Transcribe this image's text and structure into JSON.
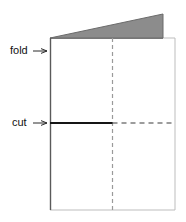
{
  "figure": {
    "background_color": "#ffffff",
    "labels": {
      "fold": "fold",
      "cut": "cut"
    },
    "arrow_glyph": "→",
    "colors": {
      "wedge_fill": "#8c8c8c",
      "wedge_stroke": "#6b6b6b",
      "fold_edge": "#5a5a5a",
      "sheet_edge": "#bdbdbd",
      "center_dash": "#9a9a9a",
      "cut_solid": "#151515",
      "cut_dash": "#3a3a3a",
      "text": "#111111",
      "arrow": "#2a2a2a"
    },
    "geometry": {
      "sheet": {
        "left": 50,
        "top": 38,
        "right": 175,
        "bottom": 210
      },
      "wedge": {
        "apex_x": 50,
        "apex_y": 38,
        "peak_x": 163,
        "peak_y": 14,
        "base_right_x": 163,
        "base_right_y": 38
      },
      "center_line_x": 112,
      "cut_line_y": 123
    },
    "annotations": [
      {
        "name": "fold",
        "text_x": 10,
        "text_y": 51,
        "arrow_x1": 33,
        "arrow_x2": 47,
        "arrow_y": 51,
        "target": "left fold edge of folded sheet"
      },
      {
        "name": "cut",
        "text_x": 12,
        "text_y": 123,
        "arrow_x1": 33,
        "arrow_x2": 47,
        "arrow_y": 123,
        "target": "horizontal cut line"
      }
    ]
  }
}
